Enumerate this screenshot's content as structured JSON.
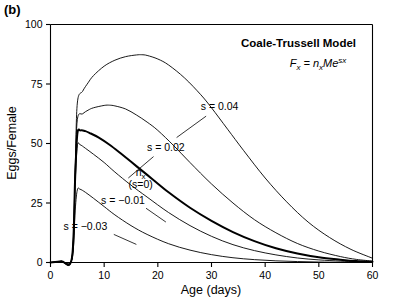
{
  "panel": {
    "label": "(b)"
  },
  "annotations": {
    "model_title": "Coale-Trussell Model",
    "formula_plain": "Fx = nxMe^sx",
    "formula_parts": {
      "f": "F",
      "f_sub": "x",
      "eq": " = ",
      "n": "n",
      "n_sub": "x",
      "m": "Me",
      "exp": "sx"
    }
  },
  "chart_data": {
    "type": "line",
    "title": "Coale-Trussell Model",
    "xlabel": "Age (days)",
    "ylabel": "Eggs/Female",
    "xlim": [
      0,
      60
    ],
    "ylim": [
      0,
      100
    ],
    "xticks": [
      0,
      10,
      20,
      30,
      40,
      50,
      60
    ],
    "yticks": [
      0,
      25,
      50,
      75,
      100
    ],
    "grid": false,
    "legend_position": "inline-labels",
    "series": [
      {
        "name": "s = 0.04",
        "label": "s = 0.04",
        "s": 0.04,
        "bold": false,
        "label_x": 31.5,
        "label_y": 64,
        "leader": [
          [
            29.0,
            61.5
          ],
          [
            23.5,
            52.5
          ]
        ],
        "x": [
          0,
          2,
          4,
          4.6,
          5,
          6,
          7,
          8,
          10,
          12,
          14,
          16,
          17,
          18,
          20,
          22,
          25,
          28,
          30,
          33,
          36,
          40,
          44,
          48,
          52,
          56,
          60
        ],
        "y": [
          0,
          0.5,
          2,
          40,
          67,
          72,
          75.5,
          78.5,
          82.5,
          85,
          86.5,
          87.2,
          87.3,
          87,
          85.5,
          83,
          77.5,
          70.5,
          65,
          56,
          47,
          35.5,
          25.5,
          17,
          10.5,
          5.5,
          1.8
        ]
      },
      {
        "name": "s = 0.02",
        "label": "s = 0.02",
        "s": 0.02,
        "bold": false,
        "label_x": 21.5,
        "label_y": 47,
        "leader": [
          [
            19.2,
            44.5
          ],
          [
            14.5,
            35.5
          ]
        ],
        "x": [
          0,
          2,
          4,
          4.6,
          5,
          6,
          7,
          8,
          10,
          11,
          12,
          14,
          16,
          18,
          20,
          23,
          26,
          30,
          34,
          38,
          42,
          46,
          50,
          54,
          57,
          60
        ],
        "y": [
          0,
          0.5,
          2,
          38,
          60,
          62.5,
          64,
          65,
          66,
          66.1,
          65.8,
          64.5,
          62,
          59,
          55.5,
          49,
          42,
          33,
          25,
          18,
          12.5,
          8,
          4.8,
          2.5,
          1.3,
          0.6
        ]
      },
      {
        "name": "nx (s=0)",
        "label": "nx",
        "sublabel": "(s=0)",
        "s": 0,
        "bold": true,
        "label_x": 16.8,
        "label_y": 36.5,
        "leader": [],
        "x": [
          0,
          2,
          4,
          4.6,
          5,
          5.6,
          6.5,
          7.5,
          9,
          11,
          13,
          16,
          19,
          22,
          26,
          30,
          34,
          38,
          42,
          46,
          50,
          54,
          57,
          60
        ],
        "y": [
          0,
          0.5,
          2,
          36,
          54,
          55.5,
          55.2,
          54.2,
          52.5,
          49.5,
          46,
          40.5,
          35,
          29.5,
          23,
          17.5,
          12.8,
          9,
          6,
          3.8,
          2.2,
          1.2,
          0.6,
          0.3
        ]
      },
      {
        "name": "s = -0.01",
        "label": "s = −0.01",
        "s": -0.01,
        "bold": false,
        "label_x": 13.5,
        "label_y": 24.5,
        "leader": [
          [
            17.8,
            22.8
          ],
          [
            21.5,
            17.0
          ]
        ],
        "x": [
          0,
          2,
          4,
          4.6,
          5,
          5.5,
          6.5,
          8,
          10,
          12,
          15,
          18,
          22,
          26,
          30,
          34,
          38,
          42,
          46,
          50,
          54,
          57,
          60
        ],
        "y": [
          0,
          0.4,
          1.8,
          34,
          49,
          49.5,
          48,
          45.5,
          42,
          38,
          32.5,
          27.5,
          21,
          15.5,
          11,
          7.5,
          5,
          3.2,
          1.9,
          1.1,
          0.6,
          0.3,
          0.15
        ]
      },
      {
        "name": "s = -0.03",
        "label": "s = −0.03",
        "s": -0.03,
        "bold": false,
        "label_x": 6.5,
        "label_y": 13.5,
        "leader": [
          [
            11.8,
            11.8
          ],
          [
            16.0,
            7.6
          ]
        ],
        "x": [
          0,
          2,
          4,
          4.6,
          5,
          5.5,
          6.5,
          8,
          10,
          12,
          15,
          18,
          22,
          26,
          30,
          34,
          38,
          42,
          46,
          50,
          54,
          57,
          60
        ],
        "y": [
          0,
          0.3,
          1.4,
          22,
          30.5,
          30.8,
          29.5,
          27,
          23.5,
          20,
          15.5,
          11.8,
          7.9,
          5.2,
          3.3,
          2.0,
          1.2,
          0.7,
          0.4,
          0.2,
          0.1,
          0.05,
          0.02
        ]
      }
    ]
  }
}
